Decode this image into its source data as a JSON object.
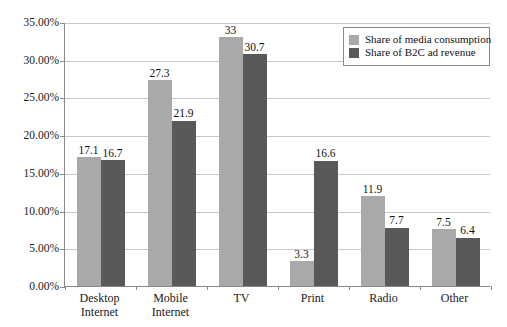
{
  "chart_data": {
    "type": "bar",
    "title": "",
    "subtitle": "",
    "xlabel": "",
    "ylabel": "",
    "categories": [
      "Desktop\nInternet",
      "Mobile\nInternet",
      "TV",
      "Print",
      "Radio",
      "Other"
    ],
    "series": [
      {
        "name": "Share of media consumption",
        "color": "#a9a9a9",
        "values": [
          17.1,
          27.3,
          33,
          3.3,
          11.9,
          7.5
        ],
        "labels": [
          "17.1",
          "27.3",
          "33",
          "3.3",
          "11.9",
          "7.5"
        ]
      },
      {
        "name": "Share of B2C ad revenue",
        "color": "#595959",
        "values": [
          16.7,
          21.9,
          30.7,
          16.6,
          7.7,
          6.4
        ],
        "labels": [
          "16.7",
          "21.9",
          "30.7",
          "16.6",
          "7.7",
          "6.4"
        ]
      }
    ],
    "ylim": [
      0,
      35
    ],
    "ytick_values": [
      0,
      5,
      10,
      15,
      20,
      25,
      30,
      35
    ],
    "ytick_labels": [
      "0.00%",
      "5.00%",
      "10.00%",
      "15.00%",
      "20.00%",
      "25.00%",
      "30.00%",
      "35.00%"
    ],
    "grid": true,
    "legend_position": "top-right",
    "legend_entries": [
      "Share of media consumption",
      "Share of B2C ad revenue"
    ]
  }
}
